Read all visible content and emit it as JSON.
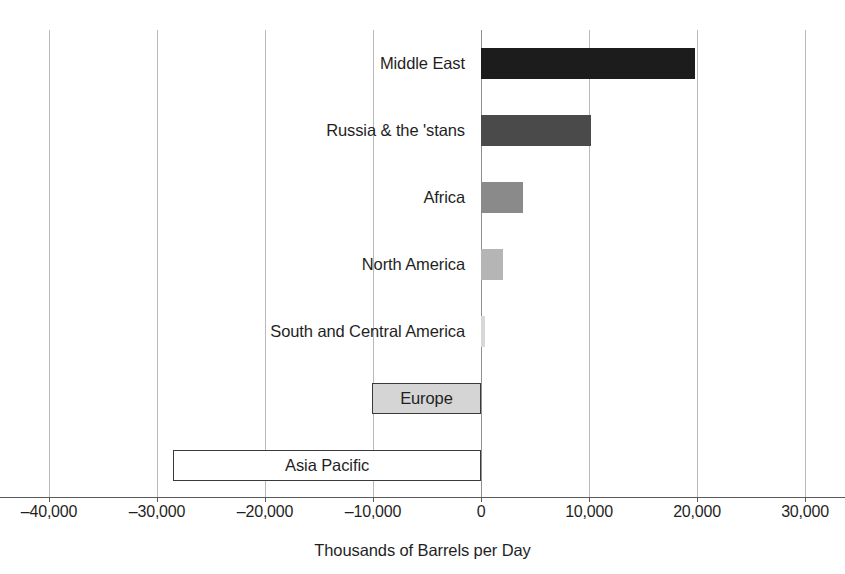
{
  "chart_data": {
    "type": "bar",
    "orientation": "horizontal",
    "title": "",
    "subtitle": "",
    "xlabel": "Thousands of Barrels per Day",
    "ylabel": "",
    "xlim": [
      -40000,
      30000
    ],
    "xticks": [
      -40000,
      -30000,
      -20000,
      -10000,
      0,
      10000,
      20000,
      30000
    ],
    "xtick_labels": [
      "–40,000",
      "–30,000",
      "–20,000",
      "–10,000",
      "0",
      "10,000",
      "20,000",
      "30,000"
    ],
    "grid": true,
    "legend": "none",
    "categories": [
      "Middle East",
      "Russia & the 'stans",
      "Africa",
      "North America",
      "South and Central America",
      "Europe",
      "Asia Pacific"
    ],
    "values": [
      19800,
      10200,
      3900,
      2000,
      400,
      -10100,
      -28500
    ],
    "bar_colors": [
      "#1c1c1c",
      "#4a4a4a",
      "#8a8a8a",
      "#b5b5b5",
      "#d8d8d8",
      "#d5d5d5",
      "#ffffff"
    ],
    "bar_border_colors": [
      "none",
      "none",
      "none",
      "none",
      "none",
      "#3a3a3a",
      "#3a3a3a"
    ],
    "label_placement": [
      "outside-left",
      "outside-left",
      "outside-left",
      "outside-left",
      "outside-left",
      "inside",
      "inside"
    ]
  },
  "axis": {
    "title": "Thousands of Barrels per Day",
    "zero_value": "0"
  },
  "colors": {
    "gridline": "#b9b9b9",
    "zero_line": "#8f8f8f",
    "baseline": "#5a5a5a",
    "text": "#1f1f1f",
    "background": "#ffffff"
  }
}
